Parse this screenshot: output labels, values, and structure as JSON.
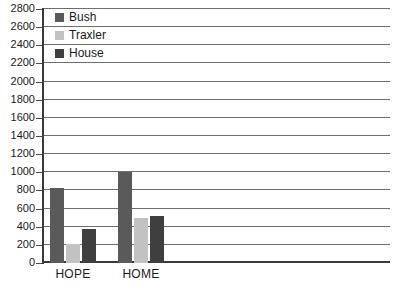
{
  "chart_data": {
    "type": "bar",
    "title": "",
    "xlabel": "",
    "ylabel": "",
    "categories": [
      "HOPE",
      "HOME"
    ],
    "series": [
      {
        "name": "Bush",
        "color": "#5a5a5a",
        "values": [
          830,
          1000
        ]
      },
      {
        "name": "Traxler",
        "color": "#c2c2c2",
        "values": [
          210,
          500
        ]
      },
      {
        "name": "House",
        "color": "#3f3f3f",
        "values": [
          370,
          515
        ]
      }
    ],
    "ylim": [
      0,
      2800
    ],
    "ytick_step": 200,
    "yticks": [
      "2800",
      "2600",
      "2400",
      "2200",
      "2000",
      "1800",
      "1600",
      "1400",
      "1200",
      "1000",
      "800",
      "600",
      "400",
      "200",
      "0"
    ],
    "grid": true,
    "legend_position": "top-left"
  },
  "legend": {
    "items": [
      {
        "label": "Bush",
        "swatch": "#5a5a5a"
      },
      {
        "label": "Traxler",
        "swatch": "#c2c2c2"
      },
      {
        "label": "House",
        "swatch": "#3f3f3f"
      }
    ]
  },
  "colors": {
    "background": "#ffffff",
    "gridline": "#6e6e6e",
    "axis": "#3a3a3a",
    "text": "#1a1a1a"
  }
}
